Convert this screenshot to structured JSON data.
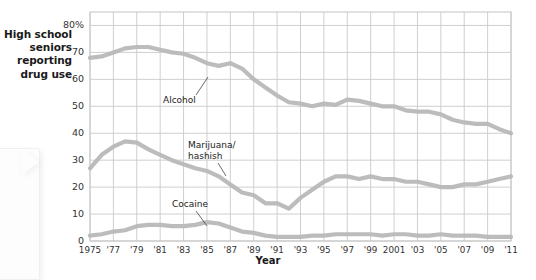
{
  "chart_data": {
    "type": "line",
    "title": "",
    "xlabel": "Year",
    "ylabel": "High school seniors reporting drug use",
    "ylim": [
      0,
      85
    ],
    "xlim": [
      1975,
      2011
    ],
    "grid": true,
    "legend_position": "inline-annotations",
    "y_ticks": [
      "0",
      "10",
      "20",
      "30",
      "40",
      "50",
      "60",
      "70",
      "80%"
    ],
    "y_tick_values": [
      0,
      10,
      20,
      30,
      40,
      50,
      60,
      70,
      80
    ],
    "x_ticks": [
      "1975",
      "'77",
      "'79",
      "'81",
      "'83",
      "'85",
      "'87",
      "'89",
      "'91",
      "'93",
      "'95",
      "'97",
      "'99",
      "2001",
      "'03",
      "'05",
      "'07",
      "'09",
      "'11"
    ],
    "x_tick_values": [
      1975,
      1977,
      1979,
      1981,
      1983,
      1985,
      1987,
      1989,
      1991,
      1993,
      1995,
      1997,
      1999,
      2001,
      2003,
      2005,
      2007,
      2009,
      2011
    ],
    "x": [
      1975,
      1976,
      1977,
      1978,
      1979,
      1980,
      1981,
      1982,
      1983,
      1984,
      1985,
      1986,
      1987,
      1988,
      1989,
      1990,
      1991,
      1992,
      1993,
      1994,
      1995,
      1996,
      1997,
      1998,
      1999,
      2000,
      2001,
      2002,
      2003,
      2004,
      2005,
      2006,
      2007,
      2008,
      2009,
      2010,
      2011
    ],
    "series": [
      {
        "name": "Alcohol",
        "color": "#b8b8b8",
        "values": [
          68,
          68.5,
          70,
          71.5,
          72,
          72,
          71,
          70,
          69.5,
          68,
          66,
          65,
          66,
          64,
          60,
          57,
          54,
          51.5,
          51,
          50,
          51,
          50.5,
          52.5,
          52,
          51,
          50,
          50,
          48.5,
          48,
          48,
          47,
          45,
          44,
          43.5,
          43.5,
          41.5,
          40
        ],
        "annotation": "Alcohol",
        "annotation_x": 1982,
        "annotation_y": 55
      },
      {
        "name": "Marijuana/hashish",
        "color": "#b8b8b8",
        "values": [
          27,
          32,
          35,
          37,
          36.5,
          34,
          32,
          30,
          28.5,
          27,
          26,
          24,
          21,
          18,
          17,
          14,
          14,
          12,
          16,
          19,
          22,
          24,
          24,
          23,
          24,
          23,
          23,
          22,
          22,
          21,
          20,
          20,
          21,
          21,
          22,
          23,
          24
        ],
        "annotation": "Marijuana/\nhashish",
        "annotation_line1": "Marijuana/",
        "annotation_line2": "hashish",
        "annotation_x": 1986,
        "annotation_y": 35
      },
      {
        "name": "Cocaine",
        "color": "#b8b8b8",
        "values": [
          2,
          2.5,
          3.5,
          4,
          5.5,
          6,
          6,
          5.5,
          5.5,
          6,
          7,
          6.5,
          5,
          3.5,
          3,
          2,
          1.5,
          1.5,
          1.5,
          2,
          2,
          2.5,
          2.5,
          2.5,
          2.5,
          2,
          2.5,
          2.5,
          2,
          2,
          2.5,
          2,
          2,
          2,
          1.5,
          1.5,
          1.5
        ],
        "annotation": "Cocaine",
        "annotation_x": 1984,
        "annotation_y": 14
      }
    ]
  },
  "axis": {
    "y_title_lines": [
      "High school",
      "seniors",
      "reporting",
      "drug use"
    ],
    "x_title": "Year"
  },
  "colors": {
    "line": "#b8b8b8",
    "grid": "#c9c9c9",
    "axis_text": "#333333",
    "title_text": "#1a1a1a",
    "background": "#ffffff"
  }
}
